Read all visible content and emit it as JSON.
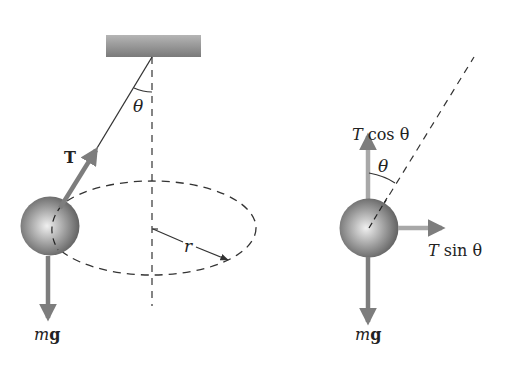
{
  "colors": {
    "background": "#ffffff",
    "line": "#333333",
    "arrow": "#7d7d7d",
    "arrow_light": "#a8a8a8",
    "ceiling": "#8a8a8a",
    "ball_light": "#e8e8e8",
    "ball_dark": "#5a5a5a"
  },
  "left_figure": {
    "tension_label": "T",
    "angle_label": "θ",
    "radius_label": "r",
    "weight_label_italic": "m",
    "weight_label_bold": "g"
  },
  "right_figure": {
    "vertical_component_label_T": "T",
    "vertical_component_label_fn": "cos θ",
    "horizontal_component_label_T": "T",
    "horizontal_component_label_fn": "sin θ",
    "angle_label": "θ",
    "weight_label_italic": "m",
    "weight_label_bold": "g"
  }
}
